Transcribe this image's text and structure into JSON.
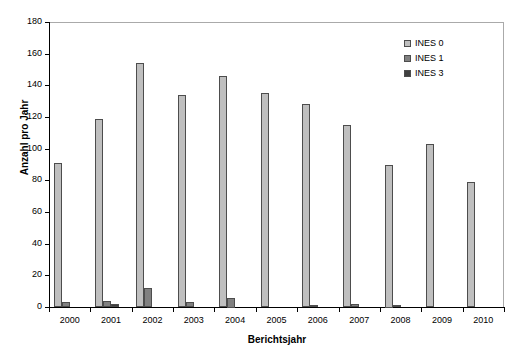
{
  "chart_data": {
    "type": "bar",
    "title": "",
    "xlabel": "Berichtsjahr",
    "ylabel": "Anzahl pro Jahr",
    "categories": [
      "2000",
      "2001",
      "2002",
      "2003",
      "2004",
      "2005",
      "2006",
      "2007",
      "2008",
      "2009",
      "2010"
    ],
    "series": [
      {
        "name": "INES 0",
        "color": "#bfbfbf",
        "values": [
          91,
          119,
          154,
          134,
          146,
          135,
          128,
          115,
          90,
          103,
          79
        ]
      },
      {
        "name": "INES 1",
        "color": "#808080",
        "values": [
          3,
          4,
          12,
          3,
          6,
          0,
          1,
          2,
          1,
          0,
          0
        ]
      },
      {
        "name": "INES 3",
        "color": "#404040",
        "values": [
          0,
          2,
          0,
          0,
          0,
          0,
          0,
          0,
          0,
          0,
          0
        ]
      }
    ],
    "ylim": [
      0,
      180
    ],
    "yticks": [
      0,
      20,
      40,
      60,
      80,
      100,
      120,
      140,
      160,
      180
    ],
    "grid": false,
    "legend_position": "top-right"
  },
  "axes": {
    "y_title": "Anzahl pro Jahr",
    "x_title": "Berichtsjahr",
    "y_tick_labels": [
      "0",
      "20",
      "40",
      "60",
      "80",
      "100",
      "120",
      "140",
      "160",
      "180"
    ],
    "x_tick_labels": [
      "2000",
      "2001",
      "2002",
      "2003",
      "2004",
      "2005",
      "2006",
      "2007",
      "2008",
      "2009",
      "2010"
    ]
  },
  "legend": {
    "entries": [
      {
        "label": "INES 0",
        "color": "#bfbfbf"
      },
      {
        "label": "INES 1",
        "color": "#808080"
      },
      {
        "label": "INES 3",
        "color": "#404040"
      }
    ]
  }
}
